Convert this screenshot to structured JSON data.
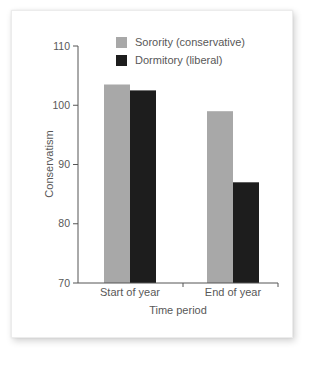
{
  "figure": {
    "name": "sorority-dormitory-conservatism-bar-chart"
  },
  "chart_data": {
    "type": "bar",
    "categories": [
      "Start of year",
      "End of year"
    ],
    "series": [
      {
        "name": "Sorority (conservative)",
        "color": "#a8a8a8",
        "values": [
          103.5,
          99
        ]
      },
      {
        "name": "Dormitory (liberal)",
        "color": "#1d1d1d",
        "values": [
          102.5,
          87
        ]
      }
    ],
    "title": "",
    "xlabel": "Time period",
    "ylabel": "Conservatism",
    "ylim": [
      70,
      110
    ],
    "yticks": [
      70,
      80,
      90,
      100,
      110
    ],
    "grid": false,
    "legend_position": "top-inside",
    "axis_color": "#555555",
    "text_color": "#585858"
  }
}
